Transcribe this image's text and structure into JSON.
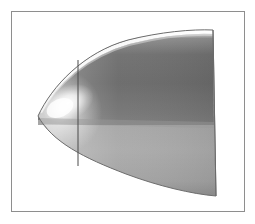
{
  "figure": {
    "caption": "Grayscale rendered solid of revolution: a pointed ogive / bullet nose viewed from the side, truncated at the right by a flat vertical cross-section plane, with a vertical silhouette line near the nose.",
    "background_color": "#ffffff"
  },
  "frame": {
    "name": "figure-border",
    "stroke_color": "#8e8e8e",
    "stroke_width": 1,
    "x": 11,
    "y": 11,
    "width": 234,
    "height": 201,
    "fill": "#ffffff"
  },
  "geometry": {
    "nose_tip": {
      "x": 38,
      "y": 116
    },
    "top_apex": {
      "x": 213,
      "y": 30
    },
    "bottom_apex": {
      "x": 213,
      "y": 196
    },
    "cut_plane_top": {
      "x": 213,
      "y": 30
    },
    "cut_plane_bottom": {
      "x": 216,
      "y": 196
    },
    "profile_control_top": {
      "x": 120,
      "y": 38
    },
    "profile_control_bottom": {
      "x": 120,
      "y": 186
    },
    "shoulder_line_y": 125,
    "silhouette_line": {
      "x": 78,
      "y_top": 60,
      "y_bottom": 166,
      "color": "#4a4a4a",
      "width": 1
    }
  },
  "shading": {
    "outline_color": "#6e6e6e",
    "upper_dark_gray": "#6b6b6b",
    "upper_mid_gray": "#8a8a8a",
    "lower_light_gray": "#a9a9a9",
    "lower_shadow_gray": "#8d8d8d",
    "specular_white": "#ffffff",
    "rim_highlight": "#f2f2f2",
    "nose_highlight_center": {
      "x": 68,
      "y": 104
    },
    "top_rim_band": "bright white sliver along upper silhouette",
    "bottom_band": "lighter gray band below shoulder line"
  },
  "labels": {
    "axes": "none",
    "legend": "none",
    "annotations": "none",
    "text_present": "false"
  }
}
